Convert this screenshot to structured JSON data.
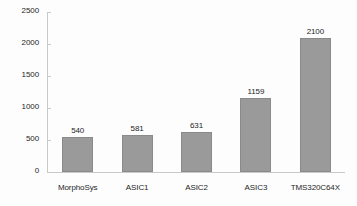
{
  "chart_data": {
    "type": "bar",
    "title": "",
    "subtitle": "",
    "xlabel": "",
    "ylabel": "",
    "categories": [
      "MorphoSys",
      "ASIC1",
      "ASIC2",
      "ASIC3",
      "TMS320C64X"
    ],
    "values": [
      540,
      581,
      631,
      1159,
      2100
    ],
    "data_labels": [
      "540",
      "581",
      "631",
      "1159",
      "2100"
    ],
    "ylim": [
      0,
      2500
    ],
    "yticks": [
      0,
      500,
      1000,
      1500,
      2000,
      2500
    ],
    "ytick_labels": [
      "0",
      "500",
      "1000",
      "1500",
      "2000",
      "2500"
    ],
    "grid": false,
    "legend": null,
    "legend_position": "none",
    "bar_color": "#9a9a9a",
    "bar_border_color": "#8a8a8a",
    "axis_color": "#c9c9c9",
    "text_color": "#262626",
    "background_color": "#fdfdfd"
  }
}
